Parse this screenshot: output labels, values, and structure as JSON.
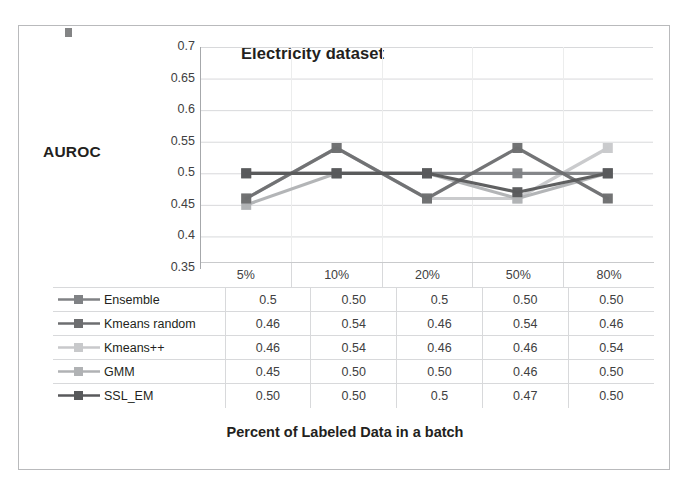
{
  "figure": {
    "title": "Electricity dataset",
    "y_axis_label": "AUROC",
    "x_axis_title": "Percent of Labeled Data in a batch"
  },
  "chart_data": {
    "type": "line",
    "title": "Electricity dataset",
    "xlabel": "Percent of Labeled Data in a batch",
    "ylabel": "AUROC",
    "categories": [
      "5%",
      "10%",
      "20%",
      "50%",
      "80%"
    ],
    "ylim": [
      0.35,
      0.7
    ],
    "yticks": [
      "0.35",
      "0.4",
      "0.45",
      "0.5",
      "0.55",
      "0.6",
      "0.65",
      "0.7"
    ],
    "grid": true,
    "legend_position": "table-left-column",
    "series": [
      {
        "name": "Ensemble",
        "values": [
          0.5,
          0.5,
          0.5,
          0.5,
          0.5
        ],
        "labels": [
          "0.5",
          "0.50",
          "0.5",
          "0.50",
          "0.50"
        ],
        "color": "#808285"
      },
      {
        "name": "Kmeans random",
        "values": [
          0.46,
          0.54,
          0.46,
          0.54,
          0.46
        ],
        "labels": [
          "0.46",
          "0.54",
          "0.46",
          "0.54",
          "0.46"
        ],
        "color": "#6d6e70"
      },
      {
        "name": "Kmeans++",
        "values": [
          0.46,
          0.54,
          0.46,
          0.46,
          0.54
        ],
        "labels": [
          "0.46",
          "0.54",
          "0.46",
          "0.46",
          "0.54"
        ],
        "color": "#c8c9cb"
      },
      {
        "name": "GMM",
        "values": [
          0.45,
          0.5,
          0.5,
          0.46,
          0.5
        ],
        "labels": [
          "0.45",
          "0.50",
          "0.50",
          "0.46",
          "0.50"
        ],
        "color": "#b0b2b4"
      },
      {
        "name": "SSL_EM",
        "values": [
          0.5,
          0.5,
          0.5,
          0.47,
          0.5
        ],
        "labels": [
          "0.50",
          "0.50",
          "0.5",
          "0.47",
          "0.50"
        ],
        "color": "#58595b"
      }
    ]
  },
  "table": {
    "column_headers": [
      "5%",
      "10%",
      "20%",
      "50%",
      "80%"
    ],
    "rows": [
      {
        "name": "Ensemble",
        "swatch": "#808285",
        "cells": [
          "0.5",
          "0.50",
          "0.5",
          "0.50",
          "0.50"
        ]
      },
      {
        "name": "Kmeans random",
        "swatch": "#6d6e70",
        "cells": [
          "0.46",
          "0.54",
          "0.46",
          "0.54",
          "0.46"
        ]
      },
      {
        "name": "Kmeans++",
        "swatch": "#c8c9cb",
        "cells": [
          "0.46",
          "0.54",
          "0.46",
          "0.46",
          "0.54"
        ]
      },
      {
        "name": "GMM",
        "swatch": "#b0b2b4",
        "cells": [
          "0.45",
          "0.50",
          "0.50",
          "0.46",
          "0.50"
        ]
      },
      {
        "name": "SSL_EM",
        "swatch": "#58595b",
        "cells": [
          "0.50",
          "0.50",
          "0.5",
          "0.47",
          "0.50"
        ]
      }
    ]
  },
  "colors": {
    "frame_border": "#b9babc",
    "grid_line": "#d8d9db",
    "axis_line": "#a6a8ab",
    "text": "#231f20"
  }
}
